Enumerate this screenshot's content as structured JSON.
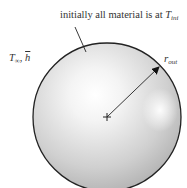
{
  "labels": {
    "initial_condition": {
      "text": "initially all material is at ",
      "symbol": "T",
      "subscript": "ini"
    },
    "environment": {
      "temp_symbol": "T",
      "temp_subscript": "∞",
      "separator": ", ",
      "coeff_symbol": "h"
    },
    "radius": {
      "symbol": "r",
      "subscript": "out"
    }
  },
  "shapes": {
    "sphere": {
      "cx": 107,
      "cy": 117,
      "r": 74,
      "stroke": "#222222",
      "fill_edge": "#b8b8b8",
      "fill_center": "#ffffff"
    },
    "center_marker": {
      "type": "plus",
      "x": 107,
      "y": 117
    },
    "radius_arrow": {
      "from": [
        107,
        117
      ],
      "to": [
        160,
        66
      ]
    },
    "leader_line": {
      "from": [
        75,
        27
      ],
      "to": [
        86,
        52
      ]
    }
  }
}
